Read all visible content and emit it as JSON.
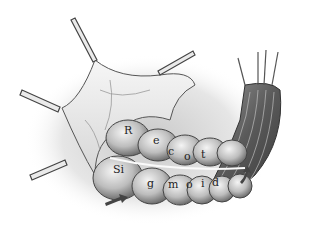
{
  "illustration": {
    "subject": "rectosigmoid colon with retracted peritoneum",
    "style": "grayscale anatomical drawing",
    "colors": {
      "background": "#ffffff",
      "ink": "#1e1e1e",
      "shade": "#8a8a8a",
      "highlight": "#f2f2f2"
    }
  },
  "labels": {
    "top_row": [
      "R",
      "e",
      "c",
      "o",
      "t"
    ],
    "bottom_row": [
      "Si",
      "g",
      "m",
      "o",
      "i",
      "d"
    ]
  },
  "arrows": [
    {
      "name": "left-arrow",
      "direction": "pointing right-up"
    },
    {
      "name": "right-arrow",
      "direction": "curved pointing up"
    }
  ]
}
